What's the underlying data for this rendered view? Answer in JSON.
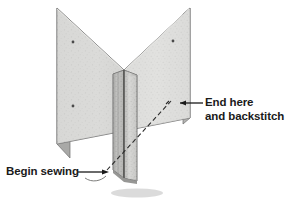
{
  "figure": {
    "background_color": "#ffffff",
    "labels": {
      "end_here_line1": "End here",
      "end_here_line2": "and backstitch",
      "begin_sewing": "Begin sewing"
    },
    "colors": {
      "fabric_left": "#d8d8d6",
      "fabric_right": "#dedede",
      "fabric_edge": "#6f6f6f",
      "flap_light": "#cfcfcf",
      "flap_dark": "#9a9a9a",
      "outline": "#5a5a5a",
      "stitch_line": "#2b2b2b",
      "text": "#1a1a1a",
      "shadow": "#b5b5b5"
    },
    "elements": {
      "left_panel_name": "left fabric panel",
      "right_panel_name": "right fabric panel",
      "seam_allowance_name": "seam allowance flaps",
      "stitch_line_name": "dashed stitching line",
      "end_leader_name": "end here leader arrow",
      "begin_leader_name": "begin sewing leader arrow",
      "thread_tail_name": "thread tail squiggle",
      "pin_marks": 3
    }
  }
}
